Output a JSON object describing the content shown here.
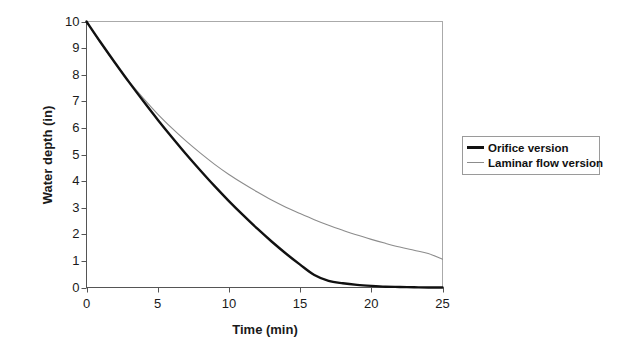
{
  "chart_data": {
    "type": "line",
    "title": "",
    "xlabel": "Time (min)",
    "ylabel": "Water depth (in)",
    "xlim": [
      0,
      25
    ],
    "ylim": [
      0,
      10
    ],
    "xticks": [
      0,
      5,
      10,
      15,
      20,
      25
    ],
    "yticks": [
      0,
      1,
      2,
      3,
      4,
      5,
      6,
      7,
      8,
      9,
      10
    ],
    "grid": false,
    "legend_position": "right-outside",
    "x": [
      0,
      1,
      2,
      3,
      4,
      5,
      6,
      7,
      8,
      9,
      10,
      11,
      12,
      13,
      14,
      15,
      16,
      17,
      18,
      19,
      20,
      21,
      22,
      23,
      24,
      25
    ],
    "series": [
      {
        "name": "Orifice version",
        "color": "#111111",
        "width": "thick",
        "values": [
          10.0,
          9.21,
          8.45,
          7.71,
          7.0,
          6.31,
          5.65,
          5.01,
          4.4,
          3.81,
          3.25,
          2.72,
          2.21,
          1.73,
          1.28,
          0.86,
          0.47,
          0.25,
          0.16,
          0.1,
          0.06,
          0.03,
          0.02,
          0.01,
          0.0,
          0.0
        ]
      },
      {
        "name": "Laminar flow version",
        "color": "#8c8c8c",
        "width": "thin",
        "values": [
          10.0,
          9.18,
          8.43,
          7.74,
          7.11,
          6.52,
          5.99,
          5.5,
          5.05,
          4.63,
          4.25,
          3.91,
          3.59,
          3.29,
          3.02,
          2.78,
          2.55,
          2.34,
          2.15,
          1.97,
          1.81,
          1.66,
          1.52,
          1.4,
          1.28,
          1.06
        ]
      }
    ]
  },
  "legend": {
    "items": [
      {
        "label": "Orifice version"
      },
      {
        "label": "Laminar flow version"
      }
    ]
  },
  "axes": {
    "y_tick_labels": [
      "10",
      "9",
      "8",
      "7",
      "6",
      "5",
      "4",
      "3",
      "2",
      "1",
      "0"
    ],
    "x_tick_labels": [
      "0",
      "5",
      "10",
      "15",
      "20",
      "25"
    ],
    "x_title": "Time (min)",
    "y_title": "Water depth (in)"
  }
}
